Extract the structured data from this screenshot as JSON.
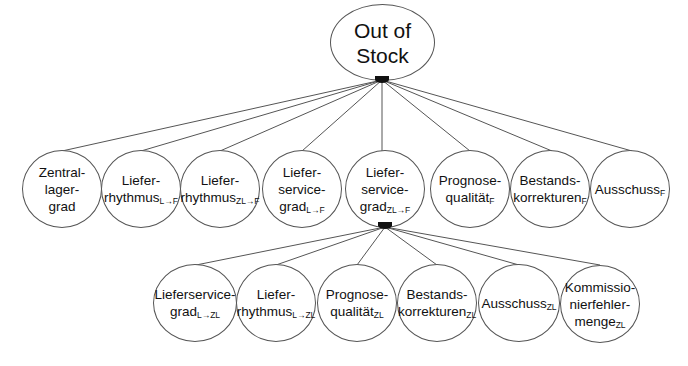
{
  "root": {
    "line1": "Out of",
    "line2": "Stock"
  },
  "level1": [
    {
      "lines": [
        "Zentral-",
        "lager-",
        "grad"
      ],
      "sub": ""
    },
    {
      "lines": [
        "Liefer-",
        "rhythmus"
      ],
      "sub": "L→F"
    },
    {
      "lines": [
        "Liefer-",
        "rhythmus"
      ],
      "sub": "ZL→F"
    },
    {
      "lines": [
        "Liefer-",
        "service-",
        "grad"
      ],
      "sub": "L→F"
    },
    {
      "lines": [
        "Liefer-",
        "service-",
        "grad"
      ],
      "sub": "ZL→F"
    },
    {
      "lines": [
        "Prognose-",
        "qualität"
      ],
      "sub": "F"
    },
    {
      "lines": [
        "Bestands-",
        "korrekturen"
      ],
      "sub": "F"
    },
    {
      "lines": [
        "Ausschuss"
      ],
      "sub": "F"
    }
  ],
  "level2": [
    {
      "lines": [
        "Lieferservice-",
        "grad"
      ],
      "sub": "L→ZL"
    },
    {
      "lines": [
        "Liefer-",
        "rhythmus"
      ],
      "sub": "L→ZL"
    },
    {
      "lines": [
        "Prognose-",
        "qualität"
      ],
      "sub": "ZL"
    },
    {
      "lines": [
        "Bestands-",
        "korrekturen"
      ],
      "sub": "ZL"
    },
    {
      "lines": [
        "Ausschuss"
      ],
      "sub": "ZL"
    },
    {
      "lines": [
        "Kommissio-",
        "nierfehler-",
        "menge"
      ],
      "sub": "ZL"
    }
  ],
  "colors": {
    "line": "#555555",
    "text": "#111111",
    "junction": "#111111"
  }
}
